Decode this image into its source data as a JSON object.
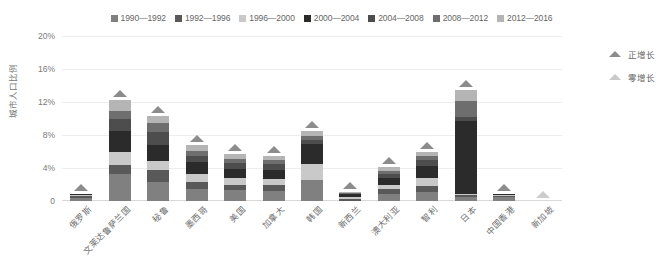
{
  "chart_data": {
    "type": "bar",
    "subtype": "stacked-bar",
    "title": "",
    "xlabel": "",
    "ylabel": "城市人口比例",
    "ylim": [
      0,
      20
    ],
    "yticks": [
      0,
      4,
      8,
      12,
      16,
      20
    ],
    "ytick_labels": [
      "0",
      "4%",
      "8%",
      "12%",
      "16%",
      "20%"
    ],
    "grid": true,
    "legend_position": "top-center",
    "categories": [
      "俄罗斯",
      "文莱达鲁萨兰国",
      "秘鲁",
      "墨西哥",
      "美国",
      "加拿大",
      "韩国",
      "新西兰",
      "澳大利亚",
      "智利",
      "日本",
      "中国香港",
      "新加坡"
    ],
    "series": [
      {
        "name": "1990—1992",
        "color": "#808080",
        "values": [
          0.35,
          3.3,
          2.3,
          1.5,
          1.3,
          1.2,
          2.5,
          0.0,
          0.9,
          1.1,
          0.5,
          0.45,
          0.0
        ]
      },
      {
        "name": "1992—1996",
        "color": "#595959",
        "values": [
          0.25,
          1.1,
          1.4,
          0.8,
          0.7,
          0.8,
          0.0,
          0.3,
          0.5,
          0.7,
          0.2,
          0.15,
          0.0
        ]
      },
      {
        "name": "1996—2000",
        "color": "#c9c9c9",
        "values": [
          0.1,
          1.5,
          1.1,
          1.0,
          0.8,
          0.7,
          2.0,
          0.2,
          0.6,
          1.0,
          0.2,
          0.1,
          0.0
        ]
      },
      {
        "name": "2000—2004",
        "color": "#2b2b2b",
        "values": [
          0.1,
          2.6,
          2.0,
          1.4,
          1.1,
          1.1,
          2.4,
          0.3,
          0.8,
          1.4,
          8.8,
          0.1,
          0.0
        ]
      },
      {
        "name": "2004—2008",
        "color": "#4d4d4d",
        "values": [
          0.05,
          1.5,
          1.6,
          0.8,
          0.7,
          0.7,
          0.5,
          0.1,
          0.5,
          0.8,
          0.5,
          0.05,
          0.0
        ]
      },
      {
        "name": "2008—2012",
        "color": "#6e6e6e",
        "values": [
          0.05,
          0.9,
          1.0,
          0.6,
          0.5,
          0.5,
          0.5,
          0.1,
          0.4,
          0.5,
          1.9,
          0.05,
          0.0
        ]
      },
      {
        "name": "2012—2016",
        "color": "#b5b5b5",
        "values": [
          0.0,
          1.3,
          0.9,
          0.7,
          0.6,
          0.5,
          0.6,
          0.1,
          0.4,
          0.5,
          1.4,
          0.0,
          0.0
        ]
      }
    ],
    "totals": [
      0.9,
      12.2,
      10.3,
      6.8,
      5.7,
      5.5,
      8.5,
      1.1,
      4.1,
      6.0,
      13.5,
      0.9,
      0.0
    ],
    "markers": [
      {
        "category": "俄罗斯",
        "type": "正增长"
      },
      {
        "category": "文莱达鲁萨兰国",
        "type": "正增长"
      },
      {
        "category": "秘鲁",
        "type": "正增长"
      },
      {
        "category": "墨西哥",
        "type": "正增长"
      },
      {
        "category": "美国",
        "type": "正增长"
      },
      {
        "category": "加拿大",
        "type": "正增长"
      },
      {
        "category": "韩国",
        "type": "正增长"
      },
      {
        "category": "新西兰",
        "type": "正增长"
      },
      {
        "category": "澳大利亚",
        "type": "正增长"
      },
      {
        "category": "智利",
        "type": "正增长"
      },
      {
        "category": "日本",
        "type": "正增长"
      },
      {
        "category": "中国香港",
        "type": "正增长"
      },
      {
        "category": "新加坡",
        "type": "零增长"
      }
    ],
    "marker_legend": [
      {
        "label": "正增长",
        "color": "#8c8c8c"
      },
      {
        "label": "零增长",
        "color": "#c9c9c9"
      }
    ]
  }
}
